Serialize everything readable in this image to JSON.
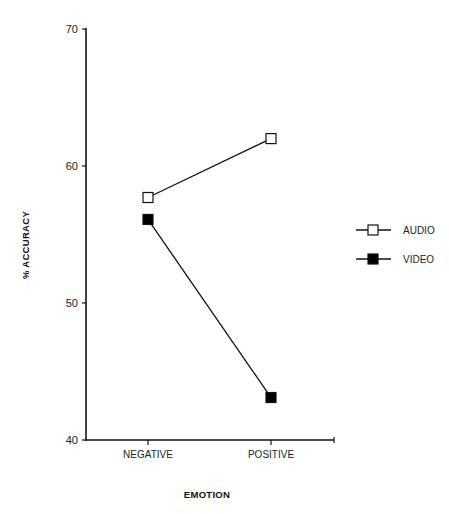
{
  "chart_data": {
    "type": "line",
    "title": "",
    "xlabel": "EMOTION",
    "ylabel": "% ACCURACY",
    "categories": [
      "NEGATIVE",
      "POSITIVE"
    ],
    "series": [
      {
        "name": "AUDIO",
        "marker": "open-square",
        "values": [
          57.7,
          62.0
        ]
      },
      {
        "name": "VIDEO",
        "marker": "filled-square",
        "values": [
          56.1,
          43.1
        ]
      }
    ],
    "ylim": [
      40,
      70
    ],
    "yticks": [
      "40",
      "50",
      "60",
      "70"
    ],
    "grid": false,
    "legend_position": "right"
  },
  "colors": {
    "line": "#111111",
    "audio_marker_fill": "#ffffff",
    "video_marker_fill": "#000000"
  }
}
